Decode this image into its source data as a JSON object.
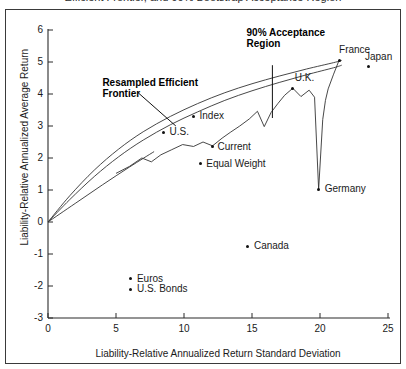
{
  "figure": {
    "caption_partial": "Efficient Frontier, and 90% Bootstrap Acceptance Region",
    "border_color": "#3a3a3a",
    "line_color": "#333333",
    "marker_color": "#111111"
  },
  "chart_data": {
    "type": "scatter",
    "title": "",
    "xlabel": "Liability-Relative Annualized Return Standard Deviation",
    "ylabel": "Liability-Relative Annualized Average Return",
    "xlim": [
      0,
      25
    ],
    "ylim": [
      -3,
      6
    ],
    "xticks": [
      0,
      5,
      10,
      15,
      20,
      25
    ],
    "yticks": [
      -3,
      -2,
      -1,
      0,
      1,
      2,
      3,
      4,
      5,
      6
    ],
    "grid": false,
    "legend": "none",
    "points": [
      {
        "name": "Index",
        "x": 10.7,
        "y": 3.3,
        "label_dx": 6,
        "label_dy": -6
      },
      {
        "name": "U.S.",
        "x": 8.5,
        "y": 2.8,
        "label_dx": 6,
        "label_dy": -6
      },
      {
        "name": "Current",
        "x": 12.1,
        "y": 2.35,
        "label_dx": 5,
        "label_dy": -6
      },
      {
        "name": "Equal Weight",
        "x": 11.2,
        "y": 1.82,
        "label_dx": 6,
        "label_dy": -6
      },
      {
        "name": "U.K.",
        "x": 18.0,
        "y": 4.18,
        "label_dx": 2,
        "label_dy": -16
      },
      {
        "name": "France",
        "x": 21.4,
        "y": 5.05,
        "label_dx": 0,
        "label_dy": -16
      },
      {
        "name": "Japan",
        "x": 23.6,
        "y": 4.85,
        "label_dx": -4,
        "label_dy": -16
      },
      {
        "name": "Germany",
        "x": 19.9,
        "y": 1.02,
        "label_dx": 6,
        "label_dy": -6
      },
      {
        "name": "Canada",
        "x": 14.7,
        "y": -0.75,
        "label_dx": 6,
        "label_dy": -6
      },
      {
        "name": "Euros",
        "x": 6.1,
        "y": -1.78,
        "label_dx": 6,
        "label_dy": -6
      },
      {
        "name": "U.S. Bonds",
        "x": 6.1,
        "y": -2.1,
        "label_dx": 6,
        "label_dy": -6
      }
    ],
    "series": [
      {
        "name": "Resampled Efficient Frontier (upper band)",
        "kind": "curve",
        "x": [
          0.0,
          1.6,
          3.4,
          5.2,
          7.0,
          9.0,
          11.0,
          13.0,
          15.0,
          17.0,
          19.0,
          21.0,
          21.6
        ],
        "y": [
          0.0,
          0.82,
          1.62,
          2.28,
          2.82,
          3.3,
          3.7,
          4.04,
          4.32,
          4.56,
          4.78,
          4.98,
          5.05
        ]
      },
      {
        "name": "Resampled Efficient Frontier (lower band)",
        "kind": "curve",
        "x": [
          0.0,
          1.6,
          3.4,
          5.2,
          7.0,
          9.0,
          11.0,
          13.0,
          15.0,
          17.0,
          19.0,
          21.0,
          21.6
        ],
        "y": [
          0.0,
          0.7,
          1.42,
          2.04,
          2.56,
          3.04,
          3.44,
          3.8,
          4.1,
          4.36,
          4.6,
          4.82,
          4.9
        ]
      },
      {
        "name": "Classical Efficient Frontier",
        "kind": "curve",
        "x": [
          0.0,
          2.0,
          4.0,
          6.0,
          7.8
        ],
        "y": [
          0.0,
          0.58,
          1.16,
          1.72,
          2.2
        ]
      },
      {
        "name": "90% Bootstrap Acceptance Boundary",
        "kind": "jagged",
        "x": [
          5.0,
          6.0,
          6.9,
          7.6,
          8.3,
          9.1,
          9.9,
          10.7,
          11.4,
          12.1,
          12.8,
          13.4,
          14.1,
          14.8,
          15.4,
          15.9,
          16.4,
          16.9,
          17.4,
          18.0,
          18.6,
          19.2,
          19.6,
          19.9,
          20.2,
          20.4,
          20.6,
          21.0,
          21.4
        ],
        "y": [
          1.52,
          1.74,
          2.0,
          1.88,
          2.1,
          2.26,
          2.42,
          2.36,
          2.5,
          2.38,
          2.62,
          2.8,
          3.0,
          3.22,
          3.46,
          2.98,
          3.42,
          3.7,
          3.96,
          4.18,
          3.92,
          4.12,
          3.9,
          1.02,
          3.2,
          3.8,
          4.16,
          4.62,
          5.05
        ]
      }
    ],
    "annotations": [
      {
        "name": "resampled-efficient-frontier",
        "text_lines": [
          "Resampled Efficient",
          "Frontier"
        ],
        "text_x": 4.0,
        "text_y": 4.38,
        "leader_from": {
          "x": 6.6,
          "y": 4.05
        },
        "leader_to": {
          "x": 9.4,
          "y": 3.0
        }
      },
      {
        "name": "acceptance-region",
        "text_lines": [
          "90% Acceptance",
          "Region"
        ],
        "text_x": 14.6,
        "text_y": 5.95,
        "bar_x": 16.5,
        "bar_y_top": 4.9,
        "bar_y_bottom": 3.25
      }
    ]
  }
}
